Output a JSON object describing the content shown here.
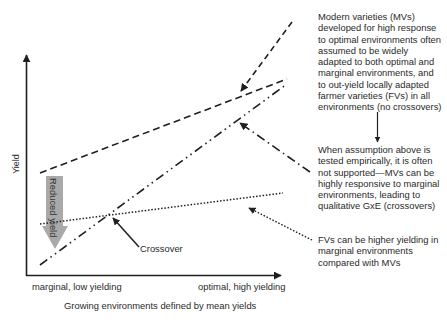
{
  "figure": {
    "y_axis_label": "Yield",
    "x_axis_label": "Growing environments defined by mean yields",
    "x_tick_left": "marginal, low yielding",
    "x_tick_right": "optimal, high yielding",
    "reduced_yield_label": "Reduced yield",
    "crossover_label": "Crossover",
    "colors": {
      "lines": "#1f1f1f",
      "reduced_arrow": "#a9a9a9",
      "text": "#2a2a2a"
    }
  },
  "notes": {
    "mv_assumption": [
      "Modern varieties (MVs)",
      "developed for high response",
      "to optimal environments often",
      "assumed to be widely",
      "adapted to both optimal and",
      "marginal environments, and",
      "to out-yield locally adapted",
      "farmer varieties (FVs) in all",
      "environments (no crossovers)"
    ],
    "empirical_test": [
      "When assumption above is",
      "tested empirically, it is often",
      "not supported—MVs can be",
      "highly responsive to marginal",
      "environments, leading to",
      "qualitative GxE (crossovers)"
    ],
    "fv_note": [
      "FVs can be higher yielding in",
      "marginal environments",
      "compared with MVs"
    ]
  },
  "lines": [
    {
      "name": "MV assumed response",
      "style": "dashed",
      "from": [
        40,
        173
      ],
      "to": [
        287,
        79
      ]
    },
    {
      "name": "MV empirical response",
      "style": "dash-dot-dot",
      "from": [
        40,
        265
      ],
      "to": [
        287,
        84
      ]
    },
    {
      "name": "FV response",
      "style": "dotted",
      "from": [
        40,
        224
      ],
      "to": [
        283,
        193
      ]
    }
  ]
}
